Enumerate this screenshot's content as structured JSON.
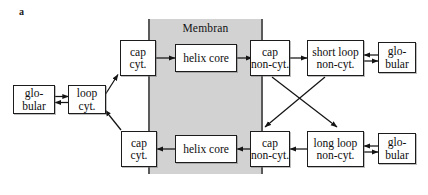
{
  "figure": {
    "panel_label": "a",
    "membrane_label": "Membran",
    "membrane_fill_color": "#d2d2d2",
    "membrane_border_color": "#5a5a5a",
    "background_color": "#ffffff",
    "line_color": "#1c1c1c",
    "width": 428,
    "height": 195
  },
  "nodes": {
    "globular_left": {
      "line1": "glo-",
      "line2": "bular"
    },
    "loop_cyt": {
      "line1": "loop",
      "line2": "cyt."
    },
    "cap_cyt_top": {
      "line1": "cap",
      "line2": "cyt."
    },
    "helix_core_top": {
      "line1": "helix core",
      "line2": ""
    },
    "cap_non_cyt_top": {
      "line1": "cap",
      "line2": "non-cyt."
    },
    "short_loop_non_cyt": {
      "line1": "short loop",
      "line2": "non-cyt."
    },
    "globular_top_right": {
      "line1": "glo-",
      "line2": "bular"
    },
    "cap_cyt_bottom": {
      "line1": "cap",
      "line2": "cyt."
    },
    "helix_core_bottom": {
      "line1": "helix core",
      "line2": ""
    },
    "cap_non_cyt_bottom": {
      "line1": "cap",
      "line2": "non-cyt."
    },
    "long_loop_non_cyt": {
      "line1": "long loop",
      "line2": "non-cyt."
    },
    "globular_bottom_right": {
      "line1": "glo-",
      "line2": "bular"
    }
  },
  "edges": [
    {
      "id": "globular-left-to-loop-cyt",
      "type": "bidirectional"
    },
    {
      "id": "loop-cyt-to-cap-cyt-top",
      "type": "directed-diagonal-up"
    },
    {
      "id": "cap-cyt-bottom-to-loop-cyt",
      "type": "directed-diagonal-up"
    },
    {
      "id": "cap-cyt-top-to-helix-core-top",
      "type": "directed-right"
    },
    {
      "id": "helix-core-top-to-cap-non-cyt-top",
      "type": "directed-right"
    },
    {
      "id": "cap-non-cyt-top-to-short-loop",
      "type": "directed-right"
    },
    {
      "id": "short-loop-to-globular-top-right",
      "type": "bidirectional"
    },
    {
      "id": "cap-non-cyt-top-to-long-loop",
      "type": "directed-diagonal-down"
    },
    {
      "id": "short-loop-to-cap-non-cyt-bottom",
      "type": "directed-diagonal-down"
    },
    {
      "id": "long-loop-to-globular-bottom-right",
      "type": "bidirectional"
    },
    {
      "id": "long-loop-to-cap-non-cyt-bottom",
      "type": "directed-left"
    },
    {
      "id": "cap-non-cyt-bottom-to-helix-core-bottom",
      "type": "directed-left"
    },
    {
      "id": "helix-core-bottom-to-cap-cyt-bottom",
      "type": "directed-left"
    }
  ]
}
